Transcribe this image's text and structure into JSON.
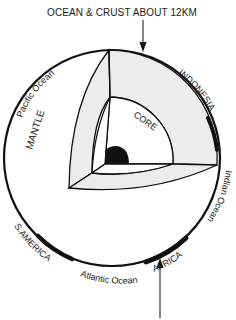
{
  "diagram": {
    "annotations": {
      "top": "OCEAN & CRUST ABOUT 12KM"
    },
    "layers": {
      "mantle": "MANTLE",
      "core": "CORE"
    },
    "regions": {
      "pacific": "Pacific Ocean",
      "indonesia": "INDONESIA",
      "indian": "Indian Ocean",
      "south_america": "S.AMERICA",
      "atlantic": "Atlantic Ocean",
      "africa": "AFRICA"
    },
    "colors": {
      "line": "#111111",
      "shaded": "#ececec",
      "background": "#ffffff",
      "inner_core": "#111111"
    }
  }
}
